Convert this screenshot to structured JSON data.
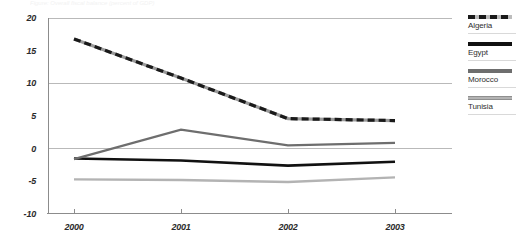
{
  "figure": {
    "caption": "Figure: Overall fiscal balance (percent of GDP)"
  },
  "legend": {
    "position": "right",
    "entries": [
      {
        "label": "Algeria",
        "style": "dashed-black",
        "color": "#1a1a1a"
      },
      {
        "label": "Egypt",
        "style": "solid-black",
        "color": "#111111"
      },
      {
        "label": "Morocco",
        "style": "solid-gray",
        "color": "#6e6e6e"
      },
      {
        "label": "Tunisia",
        "style": "solid-light",
        "color": "#b3b3b3"
      }
    ]
  },
  "axes": {
    "y_ticks": [
      "20",
      "15",
      "10",
      "5",
      "0",
      "-5",
      "-10"
    ],
    "y_values": [
      20,
      15,
      10,
      5,
      0,
      -5,
      -10
    ],
    "x_ticks": [
      "2000",
      "2001",
      "2002",
      "2003"
    ],
    "gridlines_at": [
      20,
      10,
      0
    ]
  },
  "chart_data": {
    "type": "line",
    "title": "",
    "subtitle": "",
    "xlabel": "",
    "ylabel": "",
    "x": [
      "2000",
      "2001",
      "2002",
      "2003"
    ],
    "categories": [
      "2000",
      "2001",
      "2002",
      "2003"
    ],
    "ylim": [
      -10,
      20
    ],
    "yticks": [
      -10,
      -5,
      0,
      5,
      10,
      15,
      20
    ],
    "grid": "horizontal-major",
    "legend_position": "right",
    "series": [
      {
        "name": "Algeria",
        "values": [
          16.8,
          10.8,
          4.6,
          4.3
        ],
        "color": "#1a1a1a",
        "dash": true
      },
      {
        "name": "Egypt",
        "values": [
          -1.5,
          -1.8,
          -2.6,
          -2.0
        ],
        "color": "#111111",
        "dash": false
      },
      {
        "name": "Morocco",
        "values": [
          -1.6,
          2.9,
          0.5,
          0.9
        ],
        "color": "#6e6e6e",
        "dash": false
      },
      {
        "name": "Tunisia",
        "values": [
          -4.7,
          -4.8,
          -5.1,
          -4.4
        ],
        "color": "#b3b3b3",
        "dash": false
      }
    ]
  },
  "colors": {
    "grid": "#b9b9b9",
    "axis": "#8c8c8c",
    "text": "#2b2b2b",
    "background": "#ffffff"
  }
}
